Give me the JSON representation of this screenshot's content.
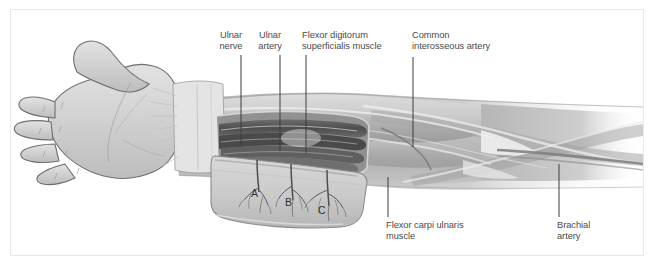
{
  "figure": {
    "frame_border_color": "#e9e9e9",
    "background_color": "#ffffff",
    "label_text_color": "#4a4a4a",
    "leader_line_color": "#3d3d3d",
    "skin_fill": "#d3d3d3",
    "skin_outline": "#6e6e6e",
    "muscle_fill": "#b4b4b4",
    "muscle_dark": "#8e8e8e",
    "vessel_dark": "#5a5a5a",
    "highlight": "#efefef"
  },
  "labels": [
    {
      "id": "ulnar-nerve",
      "text": "Ulnar\nnerve",
      "x": 211,
      "y": 29,
      "align": "center",
      "leader": {
        "x1": 240,
        "y1": 54,
        "x2": 240,
        "y2": 145
      }
    },
    {
      "id": "ulnar-artery",
      "text": "Ulnar\nartery",
      "x": 259,
      "y": 29,
      "align": "center",
      "leader": {
        "x1": 279,
        "y1": 54,
        "x2": 279,
        "y2": 150
      }
    },
    {
      "id": "flexor-digitorum-superficialis-muscle",
      "text": "Flexor digitorum\nsuperficialis muscle",
      "x": 301,
      "y": 29,
      "align": "left",
      "leader": {
        "x1": 305,
        "y1": 54,
        "x2": 305,
        "y2": 152
      }
    },
    {
      "id": "common-interosseous-artery",
      "text": "Common\ninterosseous artery",
      "x": 411,
      "y": 29,
      "align": "left",
      "leader": {
        "x1": 412,
        "y1": 56,
        "x2": 412,
        "y2": 146
      }
    },
    {
      "id": "flexor-carpi-ulnaris-muscle",
      "text": "Flexor carpi ulnaris\nmuscle",
      "x": 385,
      "y": 219,
      "align": "left",
      "leader": {
        "x1": 387,
        "y1": 176,
        "x2": 387,
        "y2": 216
      }
    },
    {
      "id": "brachial-artery",
      "text": "Brachial\nartery",
      "x": 556,
      "y": 219,
      "align": "left",
      "leader": {
        "x1": 558,
        "y1": 163,
        "x2": 558,
        "y2": 216
      }
    }
  ],
  "flap_markers": [
    {
      "id": "perforator-a",
      "text": "A",
      "x": 250,
      "y": 193
    },
    {
      "id": "perforator-b",
      "text": "B",
      "x": 284,
      "y": 202
    },
    {
      "id": "perforator-c",
      "text": "C",
      "x": 317,
      "y": 210
    }
  ],
  "caption": {
    "text": "",
    "visible": false
  }
}
